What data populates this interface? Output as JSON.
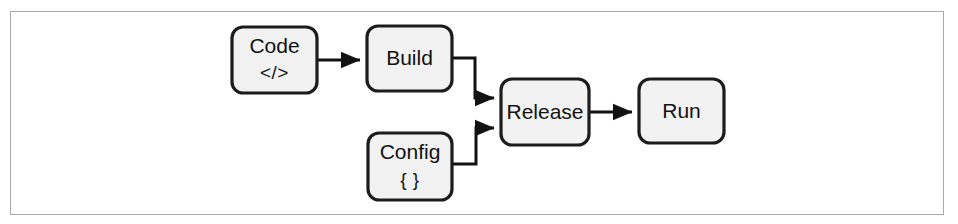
{
  "figure": {
    "type": "flow-diagram",
    "canvas": {
      "width": 958,
      "height": 224
    },
    "frame": {
      "x": 10,
      "y": 11,
      "width": 934,
      "height": 204,
      "border_color": "#a9a9a9"
    },
    "style": {
      "node_fill": "#f2f2f2",
      "node_stroke": "#1c1c1c",
      "edge_stroke": "#121212",
      "text_color": "#111111",
      "background": "#ffffff",
      "corner_radius": 11
    }
  },
  "nodes": [
    {
      "id": "code",
      "label": "Code",
      "sublabel": "</>",
      "sublabel_icon": "code-tags-icon",
      "x": 232,
      "y": 27,
      "width": 85,
      "height": 66
    },
    {
      "id": "build",
      "label": "Build",
      "sublabel": "",
      "sublabel_icon": "",
      "x": 367,
      "y": 26,
      "width": 85,
      "height": 65
    },
    {
      "id": "config",
      "label": "Config",
      "sublabel": "{ }",
      "sublabel_icon": "curly-braces-icon",
      "x": 368,
      "y": 133,
      "width": 84,
      "height": 67
    },
    {
      "id": "release",
      "label": "Release",
      "sublabel": "",
      "sublabel_icon": "",
      "x": 501,
      "y": 79,
      "width": 88,
      "height": 66
    },
    {
      "id": "run",
      "label": "Run",
      "sublabel": "",
      "sublabel_icon": "",
      "x": 639,
      "y": 79,
      "width": 85,
      "height": 64
    }
  ],
  "edges": [
    {
      "id": "code-to-build",
      "from": "code",
      "to": "build",
      "label": "",
      "shape": "straight",
      "path": "M 317 60 L 360 60"
    },
    {
      "id": "build-to-release",
      "from": "build",
      "to": "release",
      "label": "",
      "shape": "elbow-down",
      "path": "M 452 58 L 475 58 L 475 98 L 494 98"
    },
    {
      "id": "config-to-release",
      "from": "config",
      "to": "release",
      "label": "",
      "shape": "elbow-up",
      "path": "M 452 164 L 476 164 L 476 128 L 494 128"
    },
    {
      "id": "release-to-run",
      "from": "release",
      "to": "run",
      "label": "",
      "shape": "straight",
      "path": "M 589 112 L 632 112"
    }
  ]
}
